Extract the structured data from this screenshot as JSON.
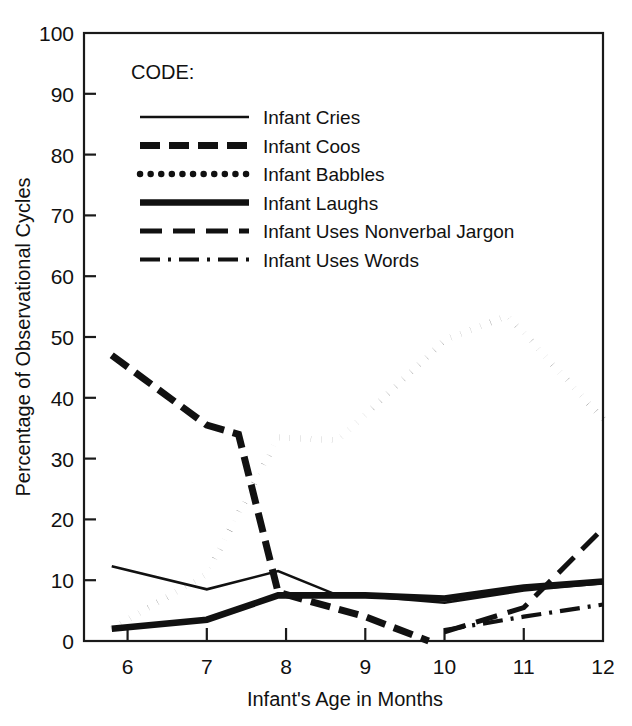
{
  "chart_data": {
    "type": "line",
    "title": "",
    "xlabel": "Infant's Age in Months",
    "ylabel": "Percentage of Observational Cycles",
    "xlim": [
      5.45,
      12.0
    ],
    "ylim": [
      0,
      100
    ],
    "xticks": [
      6,
      7,
      8,
      9,
      10,
      11,
      12
    ],
    "yticks": [
      0,
      10,
      20,
      30,
      40,
      50,
      60,
      70,
      80,
      90,
      100
    ],
    "grid": false,
    "legend_position": "upper-left-inside",
    "legend_title": "CODE:",
    "series": [
      {
        "name": "Infant Cries",
        "style": "solid-thin",
        "x": [
          5.8,
          7.0,
          7.9,
          8.6,
          10.0,
          11.0,
          12.0
        ],
        "values": [
          12.3,
          8.5,
          11.5,
          7.8,
          6.3,
          8.3,
          9.5
        ]
      },
      {
        "name": "Infant Coos",
        "style": "dashed-bold",
        "x": [
          5.8,
          7.0,
          7.4,
          7.9,
          9.0,
          9.8
        ],
        "values": [
          47.0,
          35.5,
          34.0,
          8.0,
          4.0,
          0.0
        ]
      },
      {
        "name": "Infant Babbles",
        "style": "dotted",
        "x": [
          5.8,
          7.0,
          7.9,
          8.65,
          10.0,
          10.8,
          12.0
        ],
        "values": [
          2.0,
          11.0,
          33.5,
          33.0,
          49.5,
          53.5,
          36.5
        ]
      },
      {
        "name": "Infant Laughs",
        "style": "solid-bold",
        "x": [
          5.8,
          7.0,
          7.9,
          9.0,
          10.0,
          11.0,
          12.0
        ],
        "values": [
          2.0,
          3.5,
          7.5,
          7.5,
          7.0,
          8.8,
          9.8
        ]
      },
      {
        "name": "Infant Uses Nonverbal Jargon",
        "style": "long-dash",
        "x": [
          10.0,
          11.0,
          12.0
        ],
        "values": [
          1.5,
          5.5,
          18.5
        ]
      },
      {
        "name": "Infant Uses Words",
        "style": "dash-dot",
        "x": [
          10.0,
          11.0,
          12.0
        ],
        "values": [
          1.8,
          4.0,
          6.0
        ]
      }
    ]
  },
  "axes": {
    "y_tick_labels": [
      "100",
      "90",
      "80",
      "70",
      "60",
      "50",
      "40",
      "30",
      "20",
      "10",
      "0"
    ],
    "x_tick_labels": [
      "6",
      "7",
      "8",
      "9",
      "10",
      "11",
      "12"
    ],
    "y_axis_title": "Percentage of Observational Cycles",
    "x_axis_title": "Infant's Age in Months"
  },
  "legend": {
    "header": "CODE:",
    "items": [
      {
        "label": "Infant Cries",
        "style": "solid-thin"
      },
      {
        "label": "Infant Coos",
        "style": "dashed-bold"
      },
      {
        "label": "Infant Babbles",
        "style": "dotted"
      },
      {
        "label": "Infant Laughs",
        "style": "solid-bold"
      },
      {
        "label": "Infant Uses Nonverbal Jargon",
        "style": "long-dash"
      },
      {
        "label": "Infant Uses Words",
        "style": "dash-dot"
      }
    ]
  },
  "colors": {
    "ink": "#111111",
    "background": "#ffffff"
  }
}
